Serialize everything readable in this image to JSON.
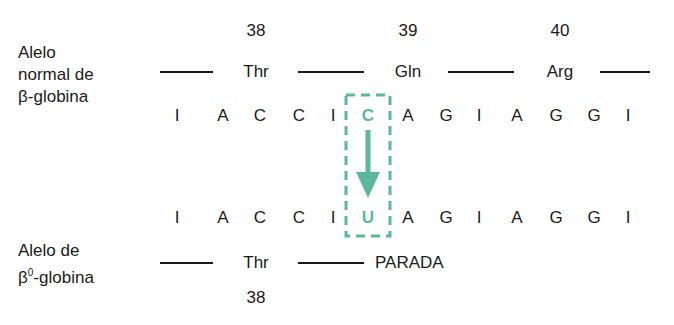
{
  "normal_allele": {
    "label_lines": [
      "Alelo",
      "normal de",
      "β-globina"
    ],
    "codon_numbers": [
      "38",
      "39",
      "40"
    ],
    "amino_acids": [
      "Thr",
      "Gln",
      "Arg"
    ],
    "sequence": [
      "I",
      "A",
      "C",
      "C",
      "I",
      "C",
      "A",
      "G",
      "I",
      "A",
      "G",
      "G",
      "I"
    ]
  },
  "mutant_allele": {
    "label_lines": [
      "Alelo de",
      "-globina"
    ],
    "label_beta": "β",
    "label_sup": "0",
    "codon_numbers": [
      "38"
    ],
    "amino_acids": [
      "Thr",
      "PARADA"
    ],
    "sequence": [
      "I",
      "A",
      "C",
      "C",
      "I",
      "U",
      "A",
      "G",
      "I",
      "A",
      "G",
      "G",
      "I"
    ]
  },
  "mutation": {
    "from": "C",
    "to": "U",
    "color": "#5bb89a"
  }
}
